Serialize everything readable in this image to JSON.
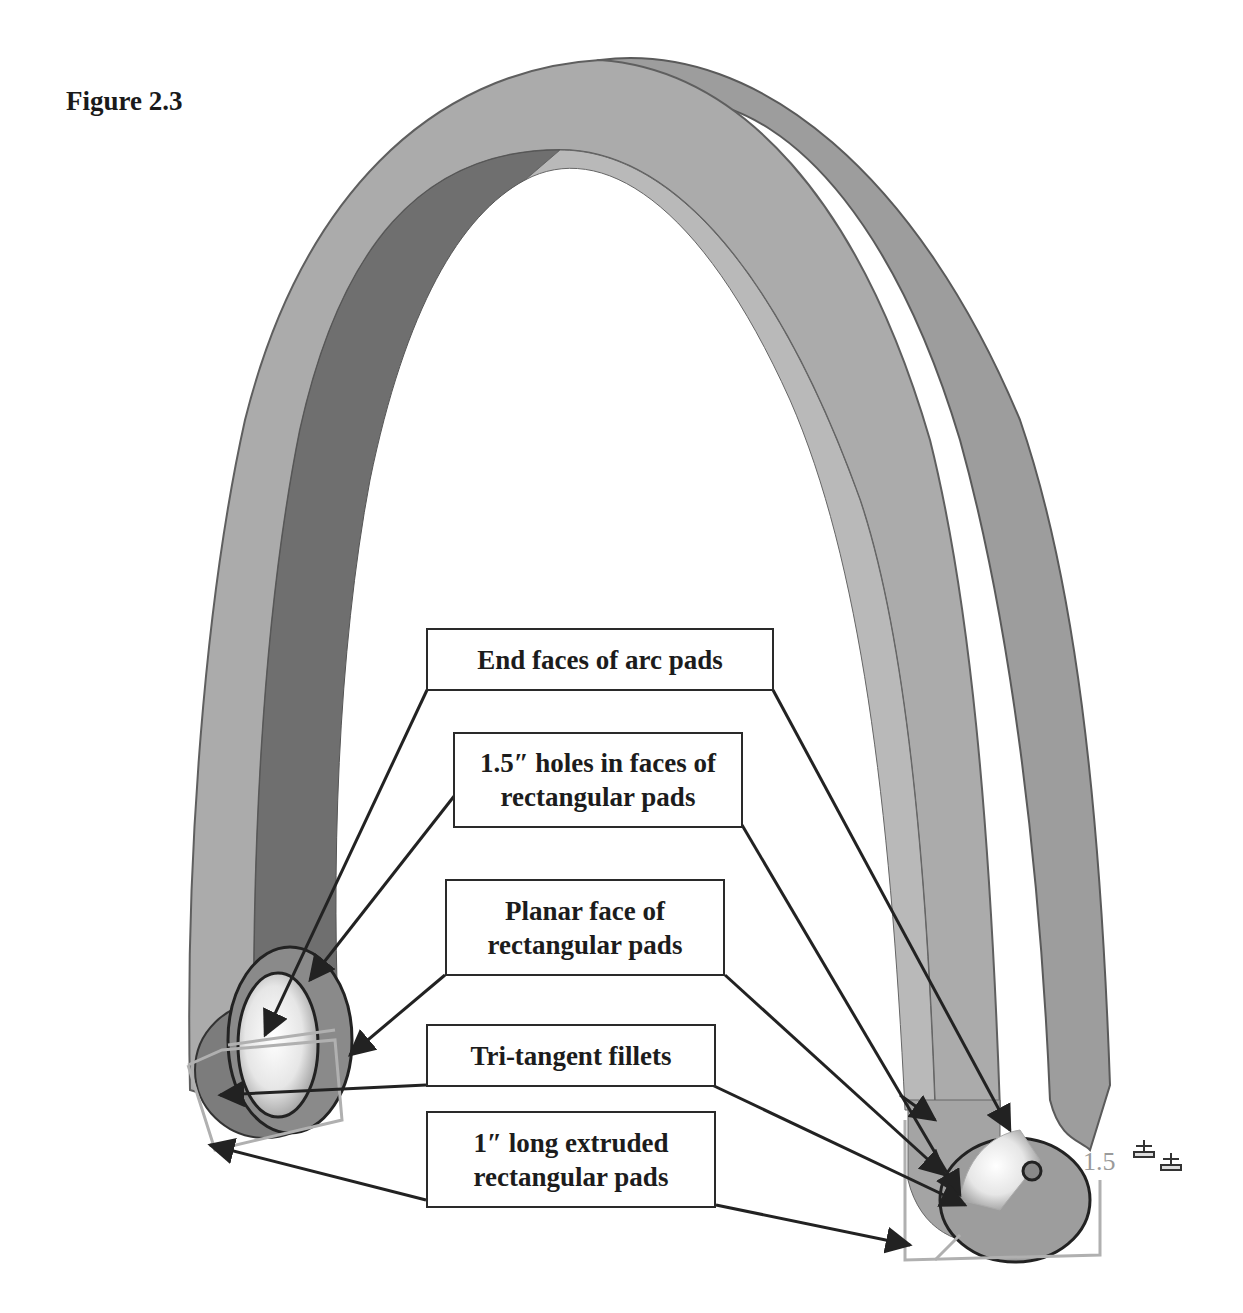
{
  "figure": {
    "title": "Figure 2.3",
    "dimension_label": "1.5"
  },
  "callouts": [
    {
      "id": "end-faces",
      "lines": [
        "End faces of arc pads"
      ]
    },
    {
      "id": "holes",
      "lines": [
        "1.5″ holes in faces of",
        "rectangular pads"
      ]
    },
    {
      "id": "planar-face",
      "lines": [
        "Planar face of",
        "rectangular pads"
      ]
    },
    {
      "id": "fillets",
      "lines": [
        "Tri-tangent fillets"
      ]
    },
    {
      "id": "extruded-pads",
      "lines": [
        "1″ long extruded",
        "rectangular pads"
      ]
    }
  ],
  "colors": {
    "outer_band": "#a9a9a9",
    "outer_band_right": "#9c9c9c",
    "inner_band": "#6e6e6e",
    "edge": "#555555",
    "wireframe": "#b0b0b0",
    "arrow": "#222222"
  }
}
